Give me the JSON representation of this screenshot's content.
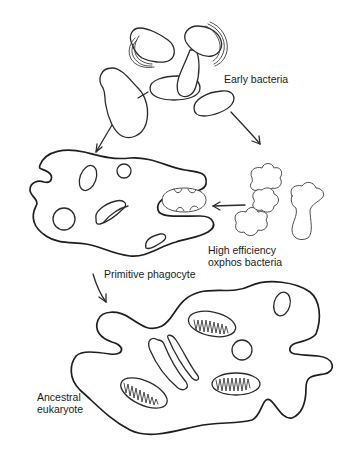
{
  "diagram": {
    "labels": {
      "early_bacteria": "Early bacteria",
      "high_efficiency_line1": "High efficiency",
      "high_efficiency_line2": "oxphos bacteria",
      "primitive_phagocyte": "Primitive phagocyte",
      "ancestral_line1": "Ancestral",
      "ancestral_line2": "eukaryote"
    },
    "stages": [
      {
        "id": "early-bacteria",
        "name": "Early bacteria"
      },
      {
        "id": "primitive-phagocyte",
        "name": "Primitive phagocyte"
      },
      {
        "id": "oxphos-bacteria",
        "name": "High efficiency oxphos bacteria"
      },
      {
        "id": "ancestral-eukaryote",
        "name": "Ancestral eukaryote"
      }
    ],
    "arrows": [
      {
        "from": "early-bacteria",
        "to": "primitive-phagocyte"
      },
      {
        "from": "early-bacteria",
        "to": "oxphos-bacteria"
      },
      {
        "from": "oxphos-bacteria",
        "to": "primitive-phagocyte"
      },
      {
        "from": "primitive-phagocyte",
        "to": "ancestral-eukaryote"
      }
    ],
    "colors": {
      "ink": "#2a2a2a",
      "background": "#ffffff"
    }
  }
}
